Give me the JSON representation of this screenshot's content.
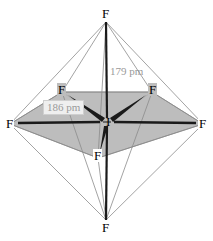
{
  "diagram": {
    "type": "molecular-structure",
    "molecule_name": "IF7",
    "colors": {
      "shade_fill": "#bdbdbd",
      "outline_stroke": "#8c8c8c",
      "bond_stroke": "#1a1a1a",
      "label_text": "#000000",
      "measure_text": "#9a9a9a",
      "measure_box_fill": "#efefef",
      "background": "#ffffff"
    },
    "atoms": [
      {
        "id": "f-top",
        "symbol": "F",
        "x": 106,
        "y": 14,
        "position": "axial-top"
      },
      {
        "id": "f-left",
        "symbol": "F",
        "x": 10,
        "y": 124,
        "position": "equatorial-left"
      },
      {
        "id": "f-right",
        "symbol": "F",
        "x": 203,
        "y": 124,
        "position": "equatorial-right"
      },
      {
        "id": "f-upper-left",
        "symbol": "F",
        "x": 62,
        "y": 90,
        "position": "equatorial-upper-left"
      },
      {
        "id": "f-upper-right",
        "symbol": "F",
        "x": 152,
        "y": 90,
        "position": "equatorial-upper-right"
      },
      {
        "id": "f-lower-mid",
        "symbol": "F",
        "x": 98,
        "y": 156,
        "position": "equatorial-front"
      },
      {
        "id": "f-bottom",
        "symbol": "F",
        "x": 106,
        "y": 228,
        "position": "axial-bottom"
      },
      {
        "id": "i-center",
        "symbol": "I",
        "x": 107,
        "y": 122,
        "position": "central-atom"
      }
    ],
    "measurements": [
      {
        "id": "axial-bond-length",
        "value": "179 pm",
        "x": 110,
        "y": 72,
        "style": "plain",
        "describes": "I-F axial bond length"
      },
      {
        "id": "equatorial-bond-length",
        "value": "186 pm",
        "x": 45,
        "y": 105,
        "style": "boxed",
        "describes": "I-F equatorial bond length"
      }
    ]
  }
}
